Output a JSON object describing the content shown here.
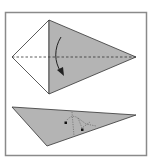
{
  "diagram": {
    "type": "origami-fold-instructions",
    "colors": {
      "frame": "#8a8a8a",
      "paper_back": "#ffffff",
      "paper_front": "#b4b4b4",
      "line": "#333333",
      "arrow": "#222222"
    },
    "steps": [
      {
        "id": "step-1",
        "description": "Kite shape with dashed valley fold line; arrow indicates folding the top half down along the center line",
        "fold_line": "valley (dashed)",
        "arrow": "curved fold-down arrow"
      },
      {
        "id": "step-2",
        "description": "Resulting flattened triangle with hidden-layer dotted lines and reference dots",
        "markers": 2
      }
    ]
  }
}
